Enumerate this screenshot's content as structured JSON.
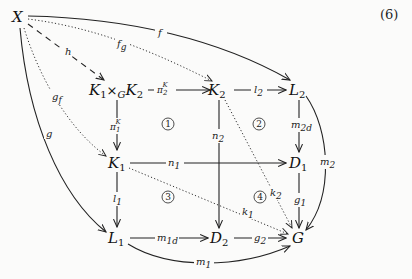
{
  "equation_number": "(6)",
  "nodes": {
    "X": {
      "base": "X"
    },
    "K1xGK2": {
      "base": "K",
      "sub1": "1",
      "times": "×",
      "timesSub": "G",
      "base2": "K",
      "sub2": "2"
    },
    "K2": {
      "base": "K",
      "sub": "2"
    },
    "L2": {
      "base": "L",
      "sub": "2"
    },
    "K1": {
      "base": "K",
      "sub": "1"
    },
    "D1": {
      "base": "D",
      "sub": "1"
    },
    "L1": {
      "base": "L",
      "sub": "1"
    },
    "D2": {
      "base": "D",
      "sub": "2"
    },
    "G": {
      "base": "G"
    }
  },
  "arrows": [
    {
      "from": "X",
      "to": "L2",
      "label": "f",
      "style": "solid",
      "shape": "curved"
    },
    {
      "from": "X",
      "to": "K2",
      "label": "f_g",
      "base": "f",
      "sub": "g",
      "style": "dotted",
      "shape": "curved"
    },
    {
      "from": "X",
      "to": "K1xGK2",
      "label": "h",
      "base": "h",
      "style": "dashed",
      "shape": "straight"
    },
    {
      "from": "X",
      "to": "K1",
      "label": "g_f",
      "base": "g",
      "sub": "f",
      "style": "dotted",
      "shape": "curved"
    },
    {
      "from": "X",
      "to": "L1",
      "label": "g",
      "base": "g",
      "style": "solid",
      "shape": "curved"
    },
    {
      "from": "K1xGK2",
      "to": "K2",
      "label": "π_2^K",
      "base": "π",
      "sub": "2",
      "sup": "K",
      "style": "solid"
    },
    {
      "from": "K1xGK2",
      "to": "K1",
      "label": "π_1^K",
      "base": "π",
      "sub": "1",
      "sup": "K",
      "style": "solid"
    },
    {
      "from": "K2",
      "to": "L2",
      "label": "l_2",
      "base": "l",
      "sub": "2",
      "style": "solid"
    },
    {
      "from": "K2",
      "to": "D2",
      "label": "n_2",
      "base": "n",
      "sub": "2",
      "style": "solid"
    },
    {
      "from": "K2",
      "to": "G",
      "label": "k_2",
      "base": "k",
      "sub": "2",
      "style": "dotted"
    },
    {
      "from": "L2",
      "to": "D1",
      "label": "m_2d",
      "base": "m",
      "sub": "2d",
      "style": "solid"
    },
    {
      "from": "L2",
      "to": "G",
      "label": "m_2",
      "base": "m",
      "sub": "2",
      "style": "solid",
      "shape": "curved"
    },
    {
      "from": "K1",
      "to": "D1",
      "label": "n_1",
      "base": "n",
      "sub": "1",
      "style": "solid"
    },
    {
      "from": "K1",
      "to": "L1",
      "label": "l_1",
      "base": "l",
      "sub": "1",
      "style": "solid"
    },
    {
      "from": "K1",
      "to": "G",
      "label": "k_1",
      "base": "k",
      "sub": "1",
      "style": "dotted"
    },
    {
      "from": "D1",
      "to": "G",
      "label": "g_1",
      "base": "g",
      "sub": "1",
      "style": "solid"
    },
    {
      "from": "L1",
      "to": "D2",
      "label": "m_1d",
      "base": "m",
      "sub": "1d",
      "style": "solid"
    },
    {
      "from": "L1",
      "to": "G",
      "label": "m_1",
      "base": "m",
      "sub": "1",
      "style": "solid",
      "shape": "curved"
    },
    {
      "from": "D2",
      "to": "G",
      "label": "g_2",
      "base": "g",
      "sub": "2",
      "style": "solid"
    }
  ],
  "regions": [
    "①",
    "②",
    "③",
    "④"
  ]
}
